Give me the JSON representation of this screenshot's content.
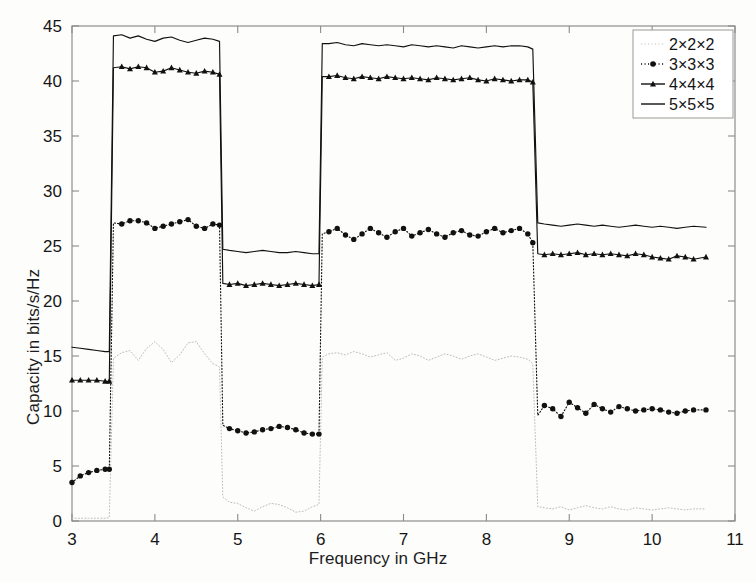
{
  "chart_data": {
    "type": "line",
    "title": "",
    "xlabel": "Frequency in GHz",
    "ylabel": "Capacity in bits/s/Hz",
    "xlim": [
      3,
      11
    ],
    "ylim": [
      0,
      45
    ],
    "xticks": [
      3,
      4,
      5,
      6,
      7,
      8,
      9,
      10,
      11
    ],
    "yticks": [
      0,
      5,
      10,
      15,
      20,
      25,
      30,
      35,
      40,
      45
    ],
    "grid": false,
    "legend_position": "top-right",
    "series": [
      {
        "name": "2×2×2",
        "style": "dotted",
        "marker": "none",
        "color": "#bdbdb8",
        "x": [
          3.0,
          3.1,
          3.2,
          3.3,
          3.4,
          3.45,
          3.5,
          3.6,
          3.7,
          3.8,
          3.9,
          4.0,
          4.1,
          4.2,
          4.3,
          4.4,
          4.5,
          4.6,
          4.7,
          4.78,
          4.82,
          4.9,
          5.0,
          5.1,
          5.2,
          5.3,
          5.4,
          5.5,
          5.6,
          5.7,
          5.8,
          5.9,
          5.98,
          6.02,
          6.1,
          6.2,
          6.3,
          6.4,
          6.5,
          6.6,
          6.7,
          6.8,
          6.9,
          7.0,
          7.1,
          7.2,
          7.3,
          7.4,
          7.5,
          7.6,
          7.7,
          7.8,
          7.9,
          8.0,
          8.1,
          8.2,
          8.3,
          8.4,
          8.5,
          8.56,
          8.62,
          8.7,
          8.8,
          8.9,
          9.0,
          9.1,
          9.2,
          9.3,
          9.4,
          9.5,
          9.6,
          9.7,
          9.8,
          9.9,
          10.0,
          10.1,
          10.2,
          10.3,
          10.4,
          10.5,
          10.65
        ],
        "y": [
          0.25,
          0.25,
          0.25,
          0.25,
          0.25,
          0.3,
          14.8,
          15.3,
          15.5,
          14.6,
          15.7,
          16.3,
          15.6,
          14.4,
          15.1,
          16.2,
          16.3,
          15.2,
          14.3,
          14.0,
          2.2,
          1.7,
          1.6,
          1.2,
          0.9,
          1.3,
          1.6,
          1.5,
          1.2,
          0.8,
          0.9,
          1.3,
          1.5,
          14.9,
          15.2,
          15.3,
          15.1,
          15.4,
          15.2,
          14.9,
          15.1,
          15.3,
          14.6,
          14.8,
          15.2,
          15.0,
          14.6,
          14.9,
          15.2,
          15.0,
          14.7,
          15.0,
          15.2,
          14.9,
          14.6,
          14.8,
          15.0,
          14.9,
          14.7,
          14.3,
          1.3,
          1.2,
          1.1,
          1.3,
          1.0,
          1.2,
          1.4,
          1.2,
          1.1,
          1.3,
          1.1,
          1.0,
          1.2,
          1.1,
          1.0,
          1.1,
          1.2,
          1.1,
          1.0,
          1.1,
          1.1
        ]
      },
      {
        "name": "3×3×3",
        "style": "dotted",
        "marker": "diamond",
        "color": "#111111",
        "x": [
          3.0,
          3.1,
          3.2,
          3.3,
          3.4,
          3.45,
          3.5,
          3.6,
          3.7,
          3.8,
          3.9,
          4.0,
          4.1,
          4.2,
          4.3,
          4.4,
          4.5,
          4.6,
          4.7,
          4.78,
          4.82,
          4.9,
          5.0,
          5.1,
          5.2,
          5.3,
          5.4,
          5.5,
          5.6,
          5.7,
          5.8,
          5.9,
          5.98,
          6.02,
          6.1,
          6.2,
          6.3,
          6.4,
          6.5,
          6.6,
          6.7,
          6.8,
          6.9,
          7.0,
          7.1,
          7.2,
          7.3,
          7.4,
          7.5,
          7.6,
          7.7,
          7.8,
          7.9,
          8.0,
          8.1,
          8.2,
          8.3,
          8.4,
          8.5,
          8.56,
          8.62,
          8.7,
          8.8,
          8.9,
          9.0,
          9.1,
          9.2,
          9.3,
          9.4,
          9.5,
          9.6,
          9.7,
          9.8,
          9.9,
          10.0,
          10.1,
          10.2,
          10.3,
          10.4,
          10.5,
          10.65
        ],
        "y": [
          3.5,
          4.1,
          4.4,
          4.6,
          4.7,
          4.7,
          27.1,
          27.0,
          27.3,
          27.3,
          27.1,
          26.6,
          26.8,
          27.0,
          27.2,
          27.4,
          26.8,
          26.6,
          27.0,
          26.9,
          8.7,
          8.4,
          8.2,
          8.0,
          8.1,
          8.3,
          8.4,
          8.6,
          8.5,
          8.3,
          8.0,
          7.9,
          7.9,
          26.1,
          26.3,
          26.6,
          26.0,
          25.6,
          26.1,
          26.6,
          26.2,
          25.8,
          26.3,
          26.6,
          25.9,
          26.2,
          26.5,
          26.1,
          25.8,
          26.2,
          26.4,
          26.0,
          25.9,
          26.3,
          26.6,
          26.2,
          26.4,
          26.6,
          26.1,
          25.3,
          9.6,
          10.5,
          10.2,
          9.5,
          10.8,
          10.3,
          9.8,
          10.6,
          10.2,
          9.9,
          10.4,
          10.2,
          10.0,
          10.1,
          10.2,
          10.1,
          9.9,
          9.8,
          10.0,
          10.1,
          10.1
        ]
      },
      {
        "name": "4×4×4",
        "style": "solid",
        "marker": "triangle",
        "color": "#111111",
        "x": [
          3.0,
          3.1,
          3.2,
          3.3,
          3.4,
          3.45,
          3.5,
          3.6,
          3.7,
          3.8,
          3.9,
          4.0,
          4.1,
          4.2,
          4.3,
          4.4,
          4.5,
          4.6,
          4.7,
          4.78,
          4.82,
          4.9,
          5.0,
          5.1,
          5.2,
          5.3,
          5.4,
          5.5,
          5.6,
          5.7,
          5.8,
          5.9,
          5.98,
          6.02,
          6.1,
          6.2,
          6.3,
          6.4,
          6.5,
          6.6,
          6.7,
          6.8,
          6.9,
          7.0,
          7.1,
          7.2,
          7.3,
          7.4,
          7.5,
          7.6,
          7.7,
          7.8,
          7.9,
          8.0,
          8.1,
          8.2,
          8.3,
          8.4,
          8.5,
          8.56,
          8.62,
          8.7,
          8.8,
          8.9,
          9.0,
          9.1,
          9.2,
          9.3,
          9.4,
          9.5,
          9.6,
          9.7,
          9.8,
          9.9,
          10.0,
          10.1,
          10.2,
          10.3,
          10.4,
          10.5,
          10.65
        ],
        "y": [
          12.8,
          12.8,
          12.8,
          12.8,
          12.7,
          12.7,
          41.2,
          41.3,
          41.1,
          41.3,
          41.2,
          40.8,
          40.9,
          41.2,
          41.0,
          40.8,
          40.7,
          40.9,
          40.8,
          40.6,
          21.6,
          21.5,
          21.6,
          21.4,
          21.5,
          21.6,
          21.5,
          21.4,
          21.5,
          21.6,
          21.5,
          21.4,
          21.5,
          40.4,
          40.4,
          40.5,
          40.3,
          40.2,
          40.4,
          40.3,
          40.2,
          40.4,
          40.3,
          40.2,
          40.3,
          40.2,
          40.1,
          40.3,
          40.2,
          40.1,
          40.2,
          40.3,
          40.1,
          40.0,
          40.2,
          40.1,
          40.0,
          40.1,
          40.1,
          39.9,
          24.3,
          24.2,
          24.3,
          24.2,
          24.3,
          24.4,
          24.2,
          24.3,
          24.2,
          24.3,
          24.2,
          24.1,
          24.3,
          24.2,
          24.0,
          23.9,
          23.8,
          24.1,
          24.0,
          23.8,
          24.0
        ]
      },
      {
        "name": "5×5×5",
        "style": "solid",
        "marker": "none",
        "color": "#111111",
        "x": [
          3.0,
          3.1,
          3.2,
          3.3,
          3.4,
          3.45,
          3.5,
          3.6,
          3.7,
          3.8,
          3.9,
          4.0,
          4.1,
          4.2,
          4.3,
          4.4,
          4.5,
          4.6,
          4.7,
          4.78,
          4.82,
          4.9,
          5.0,
          5.1,
          5.2,
          5.3,
          5.4,
          5.5,
          5.6,
          5.7,
          5.8,
          5.9,
          5.98,
          6.02,
          6.1,
          6.2,
          6.3,
          6.4,
          6.5,
          6.6,
          6.7,
          6.8,
          6.9,
          7.0,
          7.1,
          7.2,
          7.3,
          7.4,
          7.5,
          7.6,
          7.7,
          7.8,
          7.9,
          8.0,
          8.1,
          8.2,
          8.3,
          8.4,
          8.5,
          8.56,
          8.62,
          8.7,
          8.8,
          8.9,
          9.0,
          9.1,
          9.2,
          9.3,
          9.4,
          9.5,
          9.6,
          9.7,
          9.8,
          9.9,
          10.0,
          10.1,
          10.2,
          10.3,
          10.4,
          10.5,
          10.65
        ],
        "y": [
          15.8,
          15.7,
          15.6,
          15.5,
          15.4,
          15.4,
          44.1,
          44.2,
          43.9,
          44.1,
          43.8,
          43.6,
          43.9,
          44.0,
          43.7,
          43.5,
          43.7,
          43.9,
          43.8,
          43.6,
          24.7,
          24.6,
          24.5,
          24.4,
          24.5,
          24.6,
          24.5,
          24.4,
          24.4,
          24.5,
          24.4,
          24.3,
          24.3,
          43.4,
          43.4,
          43.5,
          43.3,
          43.2,
          43.4,
          43.3,
          43.2,
          43.3,
          43.2,
          43.1,
          43.3,
          43.2,
          43.1,
          43.2,
          43.1,
          43.0,
          43.2,
          43.1,
          43.0,
          43.1,
          43.2,
          43.1,
          43.2,
          43.2,
          43.1,
          42.9,
          27.1,
          27.0,
          26.9,
          26.8,
          26.9,
          27.0,
          26.9,
          26.8,
          26.9,
          26.8,
          26.7,
          26.8,
          26.9,
          26.8,
          26.7,
          26.8,
          26.7,
          26.6,
          26.7,
          26.8,
          26.7
        ]
      }
    ]
  },
  "legend": {
    "entries": [
      {
        "label": "2×2×2"
      },
      {
        "label": "3×3×3"
      },
      {
        "label": "4×4×4"
      },
      {
        "label": "5×5×5"
      }
    ]
  }
}
